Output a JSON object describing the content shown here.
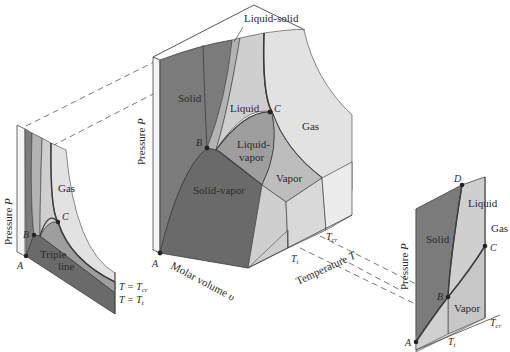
{
  "figure": {
    "type": "3D P-v-T surface with projections",
    "colors": {
      "solid": "#7b7b7b",
      "solid_vapor": "#6a6a6a",
      "liquid": "#cfcfcf",
      "liquid_vapor": "#9e9e9e",
      "vapor": "#bdbdbd",
      "gas": "#e2e2e2",
      "liquid_solid": "#b3b3b3",
      "curve": "#3c3c3c",
      "line": "#444444"
    }
  },
  "main_surface": {
    "regions": {
      "solid": "Solid",
      "liquid": "Liquid",
      "gas": "Gas",
      "liquid_vapor_1": "Liquid-",
      "liquid_vapor_2": "vapor",
      "vapor": "Vapor",
      "solid_vapor": "Solid-vapor",
      "liquid_solid": "Liquid-solid"
    },
    "points": {
      "A": "A",
      "B": "B",
      "C": "C"
    },
    "axes": {
      "pressure": "Pressure",
      "pressure_sym": "P",
      "volume": "Molar volume",
      "volume_sym": "υ",
      "temperature": "Temperature",
      "temperature_sym": "T",
      "t_cr": "T",
      "t_cr_sub": "cr",
      "t_t": "T",
      "t_t_sub": "t"
    }
  },
  "pv_projection": {
    "regions": {
      "gas": "Gas",
      "triple_1": "Triple",
      "triple_2": "line"
    },
    "points": {
      "A": "A",
      "B": "B",
      "C": "C"
    },
    "axis_pressure": "Pressure",
    "axis_pressure_sym": "P",
    "iso_cr": "T  =  T",
    "iso_cr_sub": "cr",
    "iso_t": "T  =  T",
    "iso_t_sub": "t"
  },
  "pt_projection": {
    "regions": {
      "solid": "Solid",
      "liquid": "Liquid",
      "gas": "Gas",
      "vapor": "Vapor"
    },
    "points": {
      "A": "A",
      "B": "B",
      "C": "C",
      "D": "D"
    },
    "axis_pressure": "Pressure",
    "axis_pressure_sym": "P",
    "t_t": "T",
    "t_t_sub": "t",
    "t_cr": "T",
    "t_cr_sub": "cr"
  }
}
